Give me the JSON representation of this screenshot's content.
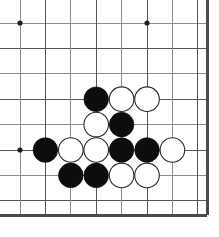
{
  "board": {
    "title": "Go board corner position",
    "description": "Bottom-right corner of a Go board showing a contact fight between black and white stones",
    "board_color": "#ffffff",
    "line_color": "#8e8e8e",
    "line_color_dark": "#555555",
    "edge_color": "#4a4a4a",
    "star_point_color": "#202020",
    "black_stone_color": "#0d0d0d",
    "white_stone_color": "#ffffff",
    "white_stone_border_color": "#2a2a2a",
    "stone_radius": 12.3,
    "star_point_radius": 2.6,
    "column_positions": [
      20,
      45.4,
      70.8,
      96.2,
      121.6,
      147,
      172.4,
      197.8
    ],
    "row_positions": [
      23,
      48.4,
      73.8,
      99.2,
      124.6,
      150,
      175.4,
      200.8
    ],
    "right_edge_x": 207,
    "bottom_edge_y": 215,
    "grid_spacing": 25.4,
    "star_points": [
      {
        "name": "star-point-top-left",
        "col": 0,
        "row": 0
      },
      {
        "name": "star-point-top-right",
        "col": 5,
        "row": 0
      },
      {
        "name": "star-point-bottom-left",
        "col": 0,
        "row": 5
      }
    ],
    "stones": [
      {
        "name": "stone-black-c3r3",
        "color": "black",
        "col": 3,
        "row": 3
      },
      {
        "name": "stone-white-c4r3",
        "color": "white",
        "col": 4,
        "row": 3
      },
      {
        "name": "stone-white-c5r3",
        "color": "white",
        "col": 5,
        "row": 3
      },
      {
        "name": "stone-white-c3r4",
        "color": "white",
        "col": 3,
        "row": 4
      },
      {
        "name": "stone-black-c4r4",
        "color": "black",
        "col": 4,
        "row": 4
      },
      {
        "name": "stone-black-c1r5",
        "color": "black",
        "col": 1,
        "row": 5
      },
      {
        "name": "stone-white-c2r5",
        "color": "white",
        "col": 2,
        "row": 5
      },
      {
        "name": "stone-white-c3r5",
        "color": "white",
        "col": 3,
        "row": 5
      },
      {
        "name": "stone-black-c4r5",
        "color": "black",
        "col": 4,
        "row": 5
      },
      {
        "name": "stone-black-c5r5",
        "color": "black",
        "col": 5,
        "row": 5
      },
      {
        "name": "stone-white-c6r5",
        "color": "white",
        "col": 6,
        "row": 5
      },
      {
        "name": "stone-black-c2r6",
        "color": "black",
        "col": 2,
        "row": 6
      },
      {
        "name": "stone-black-c3r6",
        "color": "black",
        "col": 3,
        "row": 6
      },
      {
        "name": "stone-white-c4r6",
        "color": "white",
        "col": 4,
        "row": 6
      },
      {
        "name": "stone-white-c5r6",
        "color": "white",
        "col": 5,
        "row": 6
      }
    ],
    "counts": {
      "black_stones": 7,
      "white_stones": 8,
      "total_stones": 15
    }
  }
}
